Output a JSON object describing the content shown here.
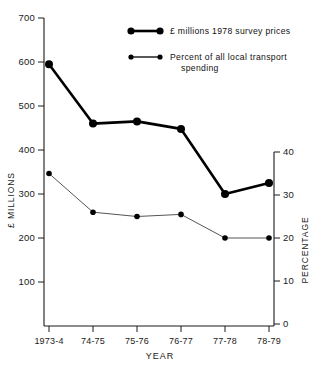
{
  "chart_data": {
    "type": "line",
    "title": "",
    "xlabel": "YEAR",
    "ylabel": "£ MILLIONS",
    "y2label": "PERCENTAGE",
    "categories": [
      "1973-4",
      "74-75",
      "75-76",
      "76-77",
      "77-78",
      "78-79"
    ],
    "ylim": [
      0,
      700
    ],
    "yticks": [
      700,
      600,
      500,
      400,
      300,
      200,
      100
    ],
    "ytick_labels": [
      "700",
      "600",
      "500",
      "400",
      "300",
      "200",
      "100"
    ],
    "y2lim": [
      0,
      40
    ],
    "y2ticks": [
      40,
      30,
      20,
      10,
      0
    ],
    "y2tick_labels": [
      "40",
      "30",
      "20",
      "10",
      "0"
    ],
    "grid": false,
    "legend_position": "top-right",
    "series": [
      {
        "name": "£ millions 1978 survey prices",
        "axis": "left",
        "marker": "filled-circle-large",
        "line_width": "thick",
        "color": "#000000",
        "values": [
          595,
          460,
          465,
          448,
          300,
          325
        ]
      },
      {
        "name": "Percent of all local transport spending",
        "axis": "right",
        "marker": "filled-circle-small",
        "line_width": "thin",
        "color": "#555555",
        "values": [
          35,
          26,
          25,
          25.5,
          20,
          20
        ]
      }
    ],
    "legend": [
      {
        "label_line1": "£ millions 1978 survey prices",
        "label_line2": "",
        "style": "thick"
      },
      {
        "label_line1": "Percent of all local transport",
        "label_line2": "spending",
        "style": "thin"
      }
    ]
  },
  "colors": {
    "background": "#ffffff",
    "axis": "#1a1a1a",
    "series_primary": "#000000",
    "series_secondary": "#555555"
  }
}
